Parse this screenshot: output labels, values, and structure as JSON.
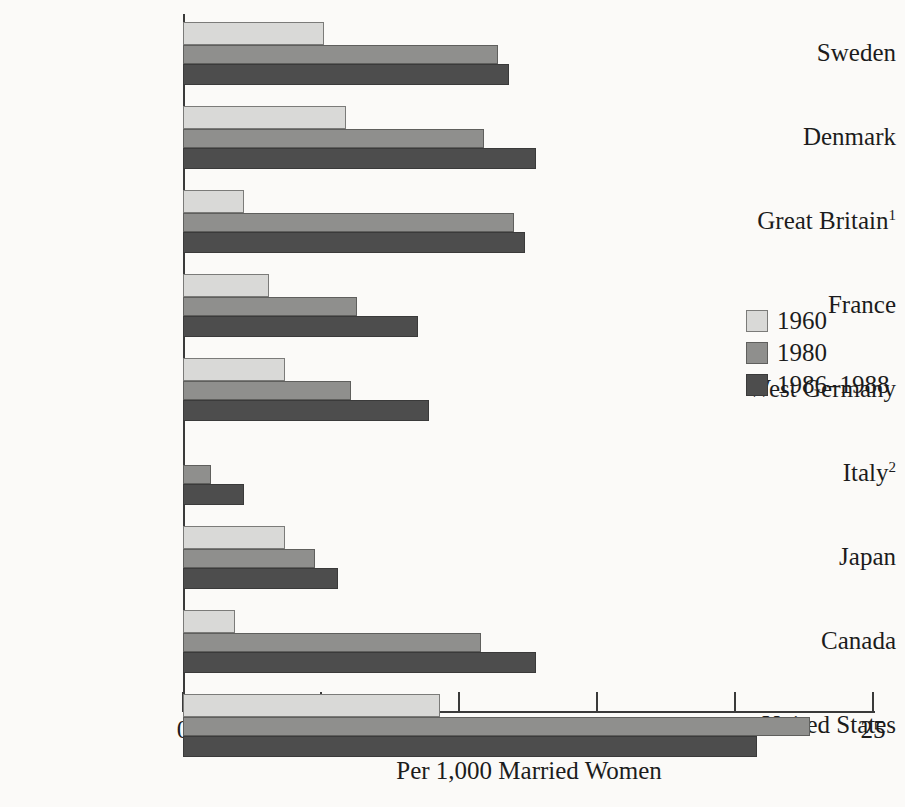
{
  "chart_data": {
    "type": "bar",
    "orientation": "horizontal",
    "title": "",
    "xlabel": "Per 1,000 Married Women",
    "ylabel": "",
    "xlim": [
      0,
      25
    ],
    "xticks": [
      0,
      5,
      10,
      15,
      20,
      25
    ],
    "xtick_labels": [
      "0",
      "5",
      "10",
      "15",
      "20",
      "25"
    ],
    "grid": false,
    "legend_position": "right",
    "categories": [
      "Sweden",
      "Denmark",
      "Great Britain",
      "France",
      "West Germany",
      "Italy",
      "Japan",
      "Canada",
      "United States"
    ],
    "category_footnotes": [
      "",
      "",
      "1",
      "",
      "",
      "2",
      "",
      "",
      ""
    ],
    "series": [
      {
        "name": "1960",
        "color": "#d9d9d7",
        "values": [
          5.1,
          5.9,
          2.2,
          3.1,
          3.7,
          null,
          3.7,
          1.9,
          9.3
        ]
      },
      {
        "name": "1980",
        "color": "#8f8f8d",
        "values": [
          11.4,
          10.9,
          12.0,
          6.3,
          6.1,
          1.0,
          4.8,
          10.8,
          22.7
        ]
      },
      {
        "name": "1986–1988",
        "color": "#4d4d4d",
        "values": [
          11.8,
          12.8,
          12.4,
          8.5,
          8.9,
          2.2,
          5.6,
          12.8,
          20.8
        ]
      }
    ]
  },
  "legend": {
    "items": [
      {
        "label": "1960"
      },
      {
        "label": "1980"
      },
      {
        "label": "1986–1988"
      }
    ]
  }
}
